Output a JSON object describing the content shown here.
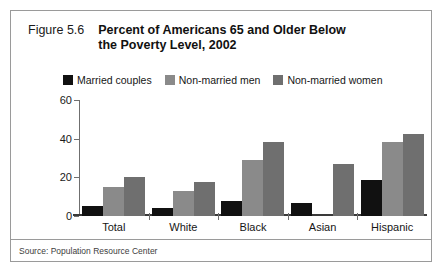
{
  "figure": {
    "number_label": "Figure 5.6",
    "title_line1": "Percent of Americans 65 and Older Below",
    "title_line2": "the Poverty Level, 2002",
    "source": "Source: Population Resource Center"
  },
  "colors": {
    "married_couples": "#111111",
    "non_married_men": "#8a8a8a",
    "non_married_women": "#6f6f6f",
    "frame_border": "#9a9a9a",
    "axis": "#6f6f6f",
    "baseline": "#3a3a3a",
    "text": "#161616"
  },
  "chart_data": {
    "type": "bar",
    "title": "Percent of Americans 65 and Older Below the Poverty Level, 2002",
    "xlabel": "",
    "ylabel": "",
    "ylim": [
      0,
      60
    ],
    "yticks": [
      0,
      20,
      40,
      60
    ],
    "ytick_labels": [
      "0",
      "20",
      "40",
      "60"
    ],
    "grid": false,
    "legend_position": "top",
    "categories": [
      "Total",
      "White",
      "Black",
      "Asian",
      "Hispanic"
    ],
    "series": [
      {
        "name": "Married couples",
        "color": "#111111",
        "values": [
          5,
          4,
          8,
          6.5,
          18.5
        ]
      },
      {
        "name": "Non-married men",
        "color": "#8a8a8a",
        "values": [
          15,
          13,
          29,
          null,
          38.5
        ]
      },
      {
        "name": "Non-married women",
        "color": "#6f6f6f",
        "values": [
          20,
          17.5,
          38.5,
          27,
          42.5
        ]
      }
    ]
  }
}
